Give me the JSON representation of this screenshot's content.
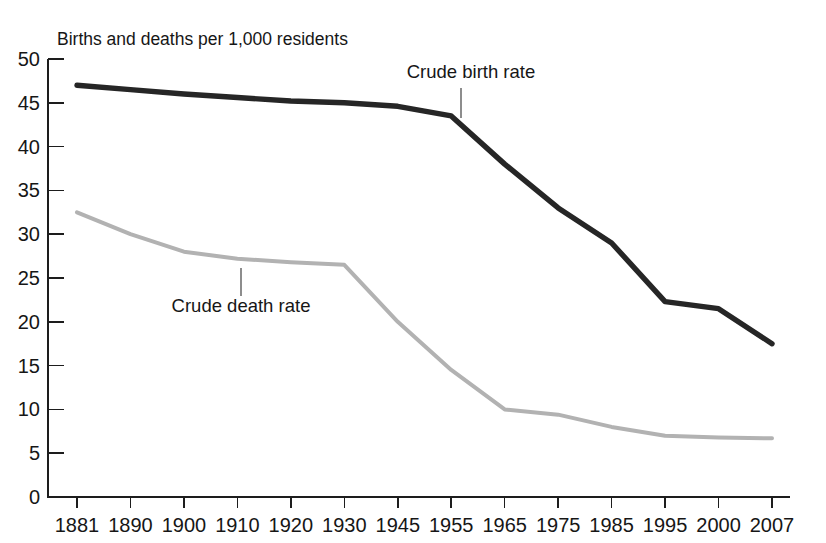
{
  "chart_data": {
    "type": "line",
    "title": "Births and deaths per 1,000 residents",
    "xlabel": "",
    "ylabel": "Births and deaths per 1,000 residents",
    "ylim": [
      0,
      50
    ],
    "ytick_step": 5,
    "grid": false,
    "legend_position": "inline-annotations",
    "categories": [
      "1881",
      "1890",
      "1900",
      "1910",
      "1920",
      "1930",
      "1945",
      "1955",
      "1965",
      "1975",
      "1985",
      "1995",
      "2000",
      "2007"
    ],
    "yticks": [
      "0",
      "5",
      "10",
      "15",
      "20",
      "25",
      "30",
      "35",
      "40",
      "45",
      "50"
    ],
    "series": [
      {
        "name": "Crude birth rate",
        "color": "#262626",
        "values": [
          47.0,
          46.5,
          46.0,
          45.6,
          45.2,
          45.0,
          44.6,
          43.5,
          38.0,
          33.0,
          29.0,
          22.3,
          21.5,
          17.5
        ]
      },
      {
        "name": "Crude death rate",
        "color": "#b2b2b2",
        "values": [
          32.5,
          30.0,
          28.0,
          27.2,
          26.8,
          26.5,
          20.0,
          14.5,
          10.0,
          9.4,
          8.0,
          7.0,
          6.8,
          6.7
        ]
      }
    ],
    "annotations": [
      {
        "text": "Crude birth rate",
        "series": "Crude birth rate",
        "anchor_category": "1955",
        "label_x": 471,
        "label_y": 78,
        "leader_x": 461,
        "leader_y1": 88,
        "leader_y2": 118
      },
      {
        "text": "Crude death rate",
        "series": "Crude death rate",
        "anchor_category": "1910",
        "label_x": 241,
        "label_y": 312,
        "leader_x": 241,
        "leader_y1": 268,
        "leader_y2": 296
      }
    ]
  },
  "colors": {
    "birth_rate": "#262626",
    "death_rate": "#b2b2b2",
    "axis": "#1d1d1d",
    "text": "#161616",
    "background": "#ffffff",
    "leader": "#8d8d8d"
  }
}
